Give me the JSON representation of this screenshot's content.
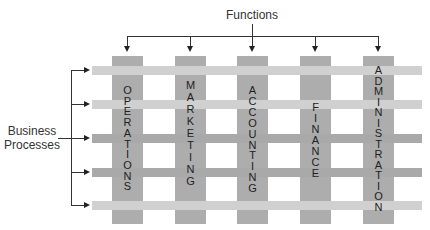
{
  "diagram": {
    "top_label": "Functions",
    "left_label_line1": "Business",
    "left_label_line2": "Processes",
    "functions": [
      {
        "name": "OPERATIONS",
        "x": 112,
        "label_top": 85
      },
      {
        "name": "MARKETING",
        "x": 175,
        "label_top": 79
      },
      {
        "name": "ACCOUNTING",
        "x": 237,
        "label_top": 85
      },
      {
        "name": "FINANCE",
        "x": 300,
        "label_top": 102
      },
      {
        "name": "ADMINISTRATION",
        "x": 363,
        "label_top": 65
      }
    ],
    "processes": [
      {
        "y": 66,
        "shade": "light"
      },
      {
        "y": 100,
        "shade": "light"
      },
      {
        "y": 134,
        "shade": "dark"
      },
      {
        "y": 168,
        "shade": "dark"
      },
      {
        "y": 201,
        "shade": "light"
      }
    ],
    "colors": {
      "column": "#adadad",
      "row_light": "#d0d0d0",
      "row_dark": "#a9a9a9",
      "line": "#333333"
    }
  }
}
